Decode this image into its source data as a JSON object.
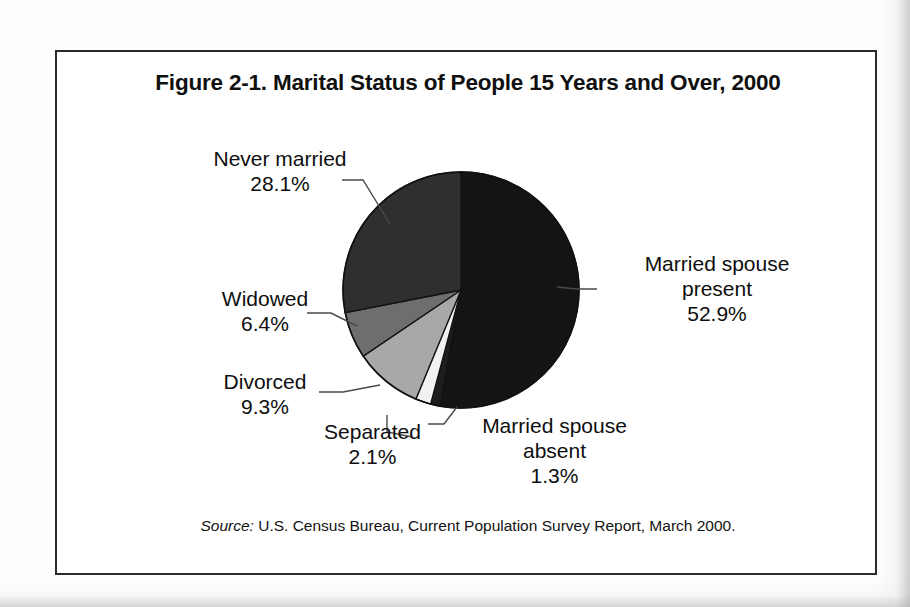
{
  "figure": {
    "title": "Figure 2-1. Marital Status of People 15 Years and Over, 2000",
    "source_prefix": "Source:",
    "source_text": " U.S. Census Bureau, Current Population Survey Report, March 2000."
  },
  "chart_data": {
    "type": "pie",
    "title": "Figure 2-1. Marital Status of People 15 Years and Over, 2000",
    "xlabel": "",
    "ylabel": "",
    "legend_position": "none",
    "grid": false,
    "units": "percent",
    "start_angle_deg": 0,
    "direction": "clockwise",
    "categories": [
      "Married spouse present",
      "Married spouse absent",
      "Separated",
      "Divorced",
      "Widowed",
      "Never married"
    ],
    "values": [
      52.9,
      1.3,
      2.1,
      9.3,
      6.4,
      28.1
    ],
    "value_labels": [
      "52.9%",
      "1.3%",
      "2.1%",
      "9.3%",
      "6.4%",
      "28.1%"
    ],
    "colors": [
      "#141414",
      "#1d1d1d",
      "#f2f2f2",
      "#a8a8a8",
      "#6e6e6e",
      "#2f2f2f"
    ],
    "slices": [
      {
        "label": "Married spouse present",
        "name_line1": "Married spouse",
        "name_line2": "present",
        "value": 52.9,
        "value_label": "52.9%",
        "color": "#141414"
      },
      {
        "label": "Married spouse absent",
        "name_line1": "Married spouse",
        "name_line2": "absent",
        "value": 1.3,
        "value_label": "1.3%",
        "color": "#1d1d1d"
      },
      {
        "label": "Separated",
        "name_line1": "Separated",
        "name_line2": "",
        "value": 2.1,
        "value_label": "2.1%",
        "color": "#f2f2f2"
      },
      {
        "label": "Divorced",
        "name_line1": "Divorced",
        "name_line2": "",
        "value": 9.3,
        "value_label": "9.3%",
        "color": "#a8a8a8"
      },
      {
        "label": "Widowed",
        "name_line1": "Widowed",
        "name_line2": "",
        "value": 6.4,
        "value_label": "6.4%",
        "color": "#6e6e6e"
      },
      {
        "label": "Never married",
        "name_line1": "Never married",
        "name_line2": "",
        "value": 28.1,
        "value_label": "28.1%",
        "color": "#2f2f2f"
      }
    ]
  },
  "labels": {
    "never_married": {
      "name": "Never married",
      "value": "28.1%"
    },
    "widowed": {
      "name": "Widowed",
      "value": "6.4%"
    },
    "divorced": {
      "name": "Divorced",
      "value": "9.3%"
    },
    "separated": {
      "name": "Separated",
      "value": "2.1%"
    },
    "married_absent": {
      "name_line1": "Married spouse",
      "name_line2": "absent",
      "value": "1.3%"
    },
    "married_present": {
      "name_line1": "Married spouse",
      "name_line2": "present",
      "value": "52.9%"
    }
  },
  "style": {
    "frame_color": "#2b2b2b",
    "text_color": "#0e0e0e",
    "page_background": "#ffffff"
  }
}
